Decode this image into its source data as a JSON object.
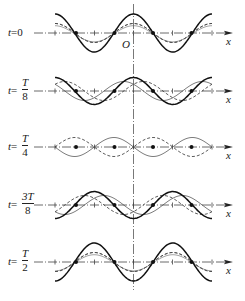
{
  "figure": {
    "axis_label": "x",
    "origin_label": "O",
    "panels": [
      {
        "time_label_prefix": "t=",
        "time_value": "0",
        "fraction": null,
        "phase": 0
      },
      {
        "time_label_prefix": "t=",
        "fraction": {
          "num": "T",
          "den": "8"
        },
        "phase": 0.125
      },
      {
        "time_label_prefix": "t=",
        "fraction": {
          "num": "T",
          "den": "4"
        },
        "phase": 0.25
      },
      {
        "time_label_prefix": "t=",
        "fraction": {
          "num": "3T",
          "den": "8"
        },
        "phase": 0.375
      },
      {
        "time_label_prefix": "t=",
        "fraction": {
          "num": "T",
          "den": "2"
        },
        "phase": 0.5
      }
    ],
    "legend": {
      "solid_thick": "resultant standing wave",
      "dashed": "component traveling waves"
    },
    "nodes_per_panel": 4,
    "colors": {
      "curve": "#1a1a1a",
      "axis": "#333333",
      "dash": "#444444"
    }
  }
}
